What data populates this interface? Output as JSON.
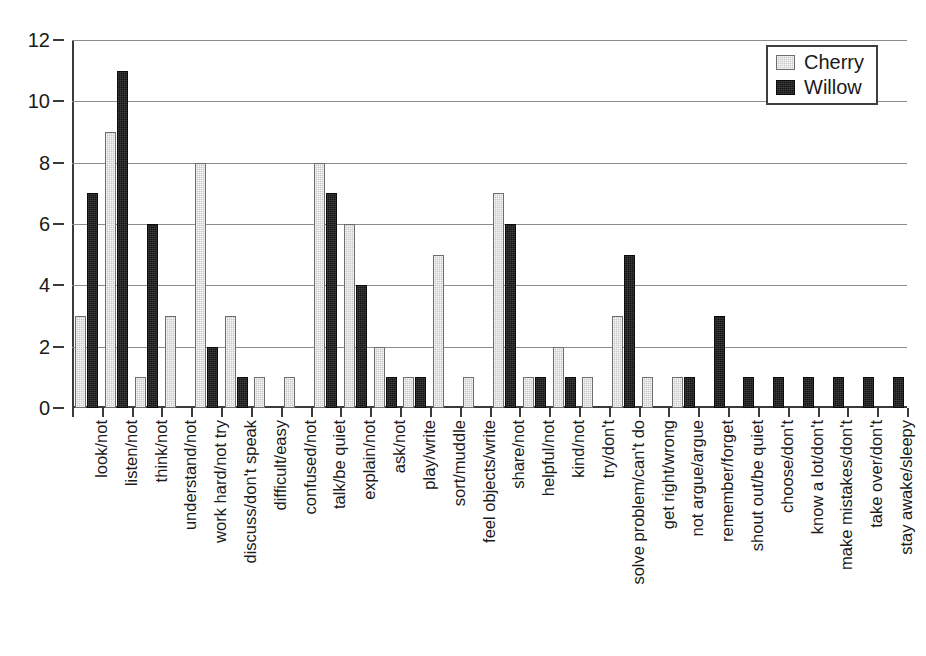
{
  "chart_data": {
    "type": "bar",
    "title": "",
    "subtitle": "",
    "xlabel": "",
    "ylabel": "",
    "ylim": [
      0,
      12
    ],
    "y_ticks": [
      0,
      2,
      4,
      6,
      8,
      10,
      12
    ],
    "grid": true,
    "legend_position": "top-right",
    "categories": [
      "look/not",
      "listen/not",
      "think/not",
      "understand/not",
      "work hard/not try",
      "discuss/don't speak",
      "difficult/easy",
      "confused/not",
      "talk/be quiet",
      "explain/not",
      "ask/not",
      "play/write",
      "sort/muddle",
      "feel objects/write",
      "share/not",
      "helpful/not",
      "kind/not",
      "try/don't",
      "solve problem/can't do",
      "get right/wrong",
      "not argue/argue",
      "remember/forget",
      "shout out/be quiet",
      "choose/don't",
      "know a lot/don't",
      "make mistakes/don't",
      "take over/don't",
      "stay awake/sleepy"
    ],
    "series": [
      {
        "name": "Cherry",
        "color": "#c9c9c9",
        "values": [
          3,
          9,
          1,
          3,
          8,
          3,
          1,
          1,
          8,
          6,
          2,
          1,
          5,
          1,
          7,
          1,
          2,
          1,
          3,
          1,
          1,
          0,
          0,
          0,
          0,
          0,
          0,
          0
        ]
      },
      {
        "name": "Willow",
        "color": "#141414",
        "values": [
          7,
          11,
          6,
          0,
          2,
          1,
          0,
          0,
          7,
          4,
          1,
          1,
          0,
          0,
          6,
          1,
          1,
          0,
          5,
          0,
          1,
          3,
          1,
          1,
          1,
          1,
          1,
          1
        ]
      }
    ]
  },
  "legend": {
    "entries": [
      {
        "label": "Cherry"
      },
      {
        "label": "Willow"
      }
    ]
  }
}
